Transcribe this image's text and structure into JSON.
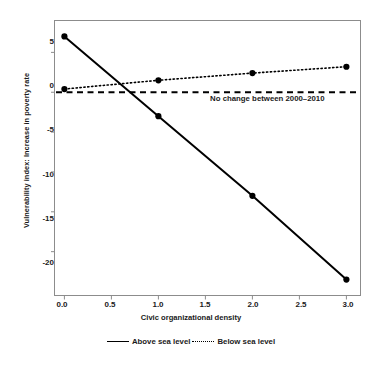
{
  "chart_data": {
    "type": "line",
    "title": "",
    "xlabel": "Civic organizational density",
    "ylabel": "Vulnerability index: Increase in poverty rate",
    "x": [
      0.0,
      1.0,
      2.0,
      3.0
    ],
    "xlim": [
      -0.1,
      3.15
    ],
    "ylim": [
      -25.5,
      9.0
    ],
    "xticks": [
      "0.0",
      "0.5",
      "1.0",
      "1.5",
      "2.0",
      "2.5",
      "3.0"
    ],
    "xtick_values": [
      0.0,
      0.5,
      1.0,
      1.5,
      2.0,
      2.5,
      3.0
    ],
    "yticks": [
      "5",
      "0",
      "-5",
      "-10",
      "-15",
      "-20"
    ],
    "ytick_values": [
      5,
      0,
      -5,
      -10,
      -15,
      -20
    ],
    "grid": false,
    "legend_position": "bottom",
    "series": [
      {
        "name": "Above sea level",
        "style": "solid",
        "color": "#000000",
        "markers": true,
        "values": [
          7.0,
          -3.0,
          -13.0,
          -23.5
        ]
      },
      {
        "name": "Below sea level",
        "style": "dotted",
        "color": "#000000",
        "markers": true,
        "values": [
          0.4,
          1.5,
          2.4,
          3.2
        ]
      }
    ],
    "reference_lines": [
      {
        "name": "no-change-line",
        "y": 0,
        "style": "dashed",
        "label": "No change between 2000–2010"
      }
    ],
    "annotations": [
      {
        "text": "No change between 2000–2010",
        "x": 1.55,
        "y": -0.9
      }
    ]
  },
  "axis": {
    "y_title": "Vulnerability index: Increase in poverty rate",
    "x_title": "Civic organizational density",
    "y_labels": [
      "5",
      "0",
      "-5",
      "-10",
      "-15",
      "-20"
    ],
    "x_labels": [
      "0.0",
      "0.5",
      "1.0",
      "1.5",
      "2.0",
      "2.5",
      "3.0"
    ]
  },
  "legend": {
    "items": [
      {
        "label": "Above sea level",
        "style": "solid"
      },
      {
        "label": "Below sea level",
        "style": "dotted"
      }
    ]
  },
  "annotation": {
    "no_change": "No change between 2000–2010"
  }
}
